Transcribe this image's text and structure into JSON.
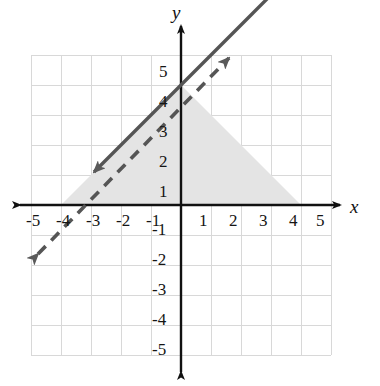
{
  "figure": {
    "kind": "coordinate-plane-graph",
    "background_color": "#ffffff",
    "axis_color": "#111111",
    "grid_color": "#d8d8d8",
    "line_color": "#555555",
    "shade_color": "#e4e4e4"
  },
  "axes": {
    "x_label": "x",
    "y_label": "y",
    "x_ticks": [
      "-5",
      "-4",
      "-3",
      "-2",
      "-1",
      "1",
      "2",
      "3",
      "4",
      "5"
    ],
    "y_ticks": [
      "5",
      "4",
      "3",
      "2",
      "1",
      "-1",
      "-2",
      "-3",
      "-4",
      "-5"
    ]
  },
  "chart_data": {
    "type": "line",
    "title": "",
    "xlabel": "x",
    "ylabel": "y",
    "xlim": [
      -5,
      5
    ],
    "ylim": [
      -5,
      5
    ],
    "grid": true,
    "legend": "none",
    "x_tick_values": [
      -5,
      -4,
      -3,
      -2,
      -1,
      1,
      2,
      3,
      4,
      5
    ],
    "y_tick_values": [
      5,
      4,
      3,
      2,
      1,
      -1,
      -2,
      -3,
      -4,
      -5
    ],
    "series": [
      {
        "name": "solid-line",
        "style": "solid",
        "slope": -1,
        "y_intercept": 4,
        "x_intercept": 4,
        "equation": "y = -x + 4",
        "arrows": "both",
        "x": [
          -2.8,
          5
        ],
        "values": [
          6.8,
          -1
        ]
      },
      {
        "name": "dashed-line",
        "style": "dashed",
        "slope": 1,
        "y_intercept": 4,
        "x_intercept": -4,
        "equation": "y = x + 4",
        "arrows": "both",
        "x": [
          -4.9,
          1.7
        ],
        "values": [
          -0.9,
          5.7
        ]
      }
    ],
    "shaded_region": {
      "name": "shaded-triangle",
      "fill": "#e4e4e4",
      "vertices": [
        [
          -4,
          0
        ],
        [
          0,
          4
        ],
        [
          4,
          0
        ]
      ],
      "description": "triangle bounded by y = x + 4, y = -x + 4 and the x-axis"
    },
    "annotations": [
      {
        "label": "intersection",
        "x": 0,
        "y": 4
      }
    ]
  },
  "tick_positions": {
    "x": [
      {
        "label": "-5",
        "left": 26,
        "top": 211
      },
      {
        "label": "-4",
        "left": 56,
        "top": 211
      },
      {
        "label": "-3",
        "left": 86,
        "top": 211
      },
      {
        "label": "-2",
        "left": 116,
        "top": 211
      },
      {
        "label": "-1",
        "left": 146,
        "top": 211
      },
      {
        "label": "1",
        "left": 199,
        "top": 211
      },
      {
        "label": "2",
        "left": 229,
        "top": 211
      },
      {
        "label": "3",
        "left": 259,
        "top": 211
      },
      {
        "label": "4",
        "left": 289,
        "top": 211
      },
      {
        "label": "5",
        "left": 316,
        "top": 211
      }
    ],
    "y": [
      {
        "label": "5",
        "left": 159,
        "top": 62
      },
      {
        "label": "4",
        "left": 159,
        "top": 92
      },
      {
        "label": "3",
        "left": 159,
        "top": 122
      },
      {
        "label": "2",
        "left": 159,
        "top": 152
      },
      {
        "label": "1",
        "left": 159,
        "top": 182
      },
      {
        "label": "-1",
        "left": 152,
        "top": 220
      },
      {
        "label": "-2",
        "left": 152,
        "top": 250
      },
      {
        "label": "-3",
        "left": 152,
        "top": 280
      },
      {
        "label": "-4",
        "left": 152,
        "top": 310
      },
      {
        "label": "-5",
        "left": 152,
        "top": 340
      }
    ]
  }
}
